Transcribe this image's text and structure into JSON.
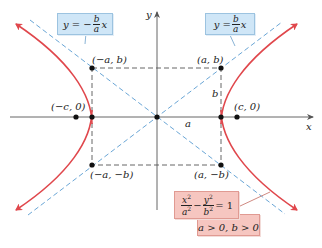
{
  "diagram": {
    "colors": {
      "hyperbola": "#e0474c",
      "asymptote": "#6aa6d6",
      "axes": "#555555",
      "box": "#555555",
      "point": "#111111",
      "callout_blue_fill": "#cfe6f7",
      "callout_pink_fill": "#f6c6c0"
    },
    "axes": {
      "x_label": "x",
      "y_label": "y"
    },
    "points": {
      "vertex_left": "(−a, b)",
      "vertex_right": "(a, b)",
      "corner_bottom_left": "(−a, −b)",
      "corner_bottom_right": "(a, −b)",
      "focus_left": "(−c, 0)",
      "focus_right": "(c, 0)"
    },
    "segment_labels": {
      "a": "a",
      "b": "b"
    },
    "asymptote_left": {
      "lhs": "y = −",
      "num": "b",
      "den": "a",
      "rhs": "x"
    },
    "asymptote_right": {
      "lhs": "y =",
      "num": "b",
      "den": "a",
      "rhs": "x"
    },
    "equation": {
      "term1_num": "x",
      "term1_den": "a",
      "minus": "−",
      "term2_num": "y",
      "term2_den": "b",
      "exp": "2",
      "rhs": "= 1"
    },
    "condition": "a > 0, b > 0"
  }
}
